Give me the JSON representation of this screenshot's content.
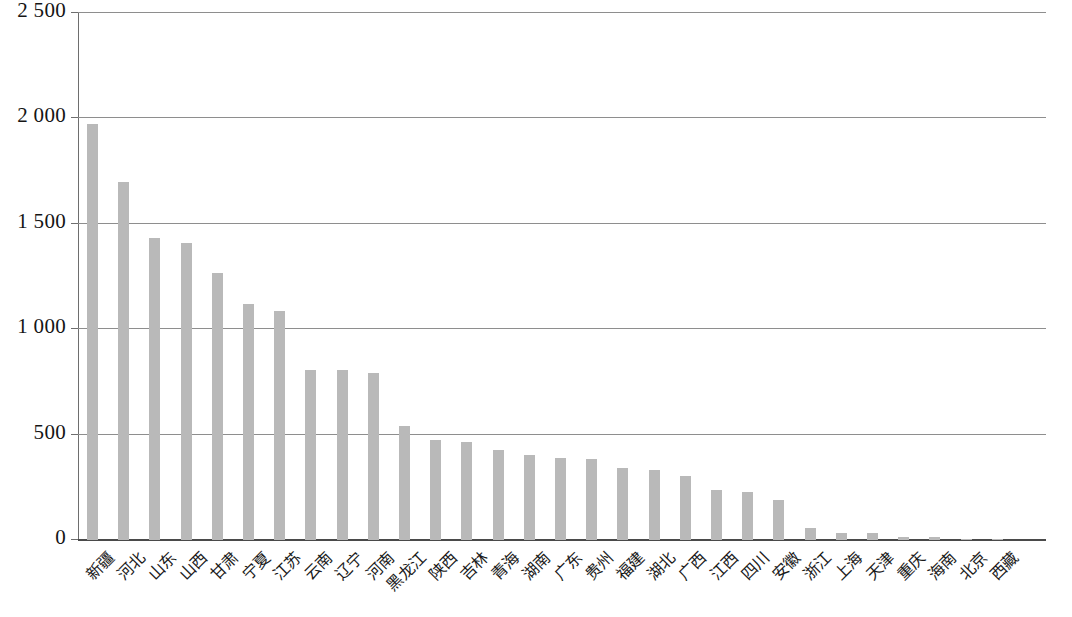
{
  "chart_data": {
    "type": "bar",
    "title": "",
    "subtitle": "",
    "xlabel": "",
    "ylabel": "",
    "ylim": [
      0,
      2500
    ],
    "grid": true,
    "legend": null,
    "orientation": "vertical",
    "bar_color": "#b9b9b9",
    "axis_color": "#6e6e6e",
    "gridline_color": "#8e8e8e",
    "ytick_labels": [
      "2 500",
      "2 000",
      "1 500",
      "1 000",
      "500",
      "0"
    ],
    "ytick_values": [
      2500,
      2000,
      1500,
      1000,
      500,
      0
    ],
    "categories": [
      "新疆",
      "河北",
      "山东",
      "山西",
      "甘肃",
      "宁夏",
      "江苏",
      "云南",
      "辽宁",
      "河南",
      "黑龙江",
      "陕西",
      "吉林",
      "青海",
      "湖南",
      "广东",
      "贵州",
      "福建",
      "湖北",
      "广西",
      "江西",
      "四川",
      "安徽",
      "浙江",
      "上海",
      "天津",
      "重庆",
      "海南",
      "北京",
      "西藏"
    ],
    "values": [
      1975,
      1700,
      1435,
      1410,
      1265,
      1120,
      1085,
      805,
      805,
      790,
      540,
      475,
      465,
      425,
      405,
      390,
      385,
      340,
      330,
      305,
      235,
      230,
      190,
      55,
      35,
      33,
      16,
      12,
      3,
      2
    ]
  }
}
